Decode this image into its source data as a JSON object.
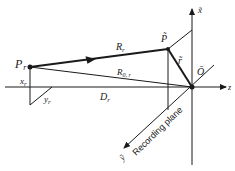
{
  "diagram": {
    "labels": {
      "source_point": "P",
      "source_point_sub": "r",
      "image_point": "P̃",
      "ray_label": "R",
      "ray_label_sub": "r",
      "reference_ray": "R",
      "reference_ray_sub": "0, r",
      "distance": "D",
      "distance_sub": "r",
      "x_offset": "x",
      "x_offset_sub": "r",
      "y_offset": "y",
      "y_offset_sub": "r",
      "radius_vector": "r̃",
      "origin": "Ō",
      "x_axis": "x̃",
      "y_axis": "ỹ",
      "z_axis": "z",
      "plane": "Recording plane"
    },
    "colors": {
      "stroke": "#1a1a1a",
      "background": "#ffffff"
    }
  }
}
